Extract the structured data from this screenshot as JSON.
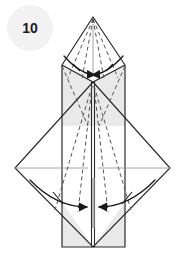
{
  "diagram": {
    "kind": "origami-folding-step",
    "step_badge": {
      "label": "10",
      "shape": "circle",
      "fill_color": "#f2f2f2",
      "text_color": "#1a1a1a",
      "center_x": 30,
      "center_y": 28,
      "radius": 23
    },
    "canvas": {
      "width": 186,
      "height": 259,
      "background_color": "#ffffff"
    },
    "colors": {
      "paper_front": "#ffffff",
      "paper_back_shaded": "#e9e9e9",
      "outline": "#2b2b2b",
      "fold_dashed": "#555555",
      "crease_thin": "#9a9a9a",
      "arrow": "#1a1a1a"
    },
    "geometry": {
      "apex_top": [
        93,
        17
      ],
      "body_left_x": 62,
      "body_right_x": 125,
      "body_top_y": 38,
      "body_bottom_y": 247,
      "upper_shoulder_y": 65,
      "cross_center": [
        93,
        82
      ],
      "diamond_left_vertex": [
        15,
        168
      ],
      "diamond_right_vertex": [
        170,
        168
      ],
      "diamond_bottom_vertex": [
        93,
        247
      ],
      "horizontal_crease_y": 168,
      "center_line_x": 93
    },
    "elements": {
      "top_point_label": "top flap apex",
      "center_vertical_crease_label": "center vertical crease",
      "horizontal_crease_label": "horizontal crease",
      "upper_left_shaded_panel_label": "upper left shaded panel",
      "upper_right_shaded_panel_label": "upper right shaded panel",
      "lower_left_shaded_panel_label": "lower left shaded panel",
      "lower_right_shaded_panel_label": "lower right shaded panel",
      "large_diamond_label": "large diamond layer"
    },
    "fold_lines": {
      "type": "valley-fold dashed",
      "upper_lines_count": 4,
      "lower_lines_count": 4,
      "description": "dashed valley fold lines radiating from the apex and from the center crossing point"
    },
    "arrows": [
      {
        "id": "upper-left-arrow",
        "label": "fold upper left flap inward",
        "direction": "inward-right",
        "path": "M 66,57 Q 82,73 96,74",
        "head_angle": 20
      },
      {
        "id": "upper-right-arrow",
        "label": "fold upper right flap inward",
        "direction": "inward-left",
        "path": "M 121,57 Q 105,73 91,74",
        "head_angle": 160
      },
      {
        "id": "lower-left-arrow",
        "label": "fold lower left flap inward",
        "direction": "inward-right",
        "path": "M 32,182 Q 58,208 86,208",
        "head_angle": 4
      },
      {
        "id": "lower-right-arrow",
        "label": "fold lower right flap inward",
        "direction": "inward-left",
        "path": "M 153,182 Q 127,208 99,208",
        "head_angle": 176
      }
    ],
    "tick_marks": {
      "count": 4,
      "label": "fold-direction tick marks crossing arrow shafts"
    }
  }
}
